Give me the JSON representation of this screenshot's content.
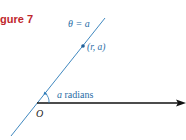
{
  "figure": {
    "label": "gure 7",
    "line_label": "θ = a",
    "point_label": "(r, a)",
    "angle_label_var": "a",
    "angle_label_text": " radians",
    "origin_label": "O"
  },
  "colors": {
    "figure_label": "#c0272d",
    "ray": "#2a7ab8",
    "text_blue": "#2a6ea6",
    "axis": "#111111",
    "point": "#1f5f99"
  },
  "geometry": {
    "origin": [
      37,
      103
    ],
    "line_start": [
      11,
      136
    ],
    "line_end": [
      105,
      18
    ],
    "axis_end": [
      186,
      103
    ],
    "point": [
      83,
      46
    ]
  }
}
